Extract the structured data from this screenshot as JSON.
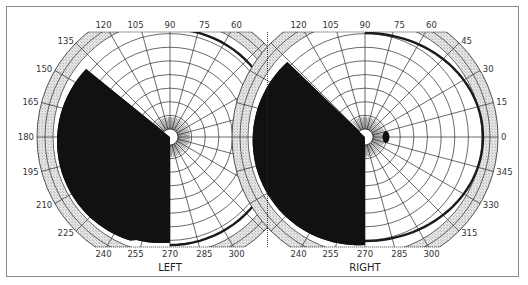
{
  "figure": {
    "type": "visual field perimetry chart (homonymous hemianopia)",
    "colors": {
      "background": "#ffffff",
      "frame": "#8a8a8a",
      "hatch_fill": "#d9d9d9",
      "grid_line": "#2a2a2a",
      "defect_fill": "#111111",
      "isopter": "#1a1a1a"
    },
    "eyes": [
      {
        "id": "left",
        "label": "LEFT",
        "center": [
          170,
          137
        ],
        "defect": "left hemifield blind (temporal), dense black field from 90 to 270 via 180, cut sloping toward 135 near top",
        "blind_spot": false,
        "angle_labels": [
          {
            "deg": 120,
            "text": "120"
          },
          {
            "deg": 105,
            "text": "105"
          },
          {
            "deg": 90,
            "text": "90"
          },
          {
            "deg": 75,
            "text": "75"
          },
          {
            "deg": 60,
            "text": "60"
          },
          {
            "deg": 135,
            "text": "135"
          },
          {
            "deg": 150,
            "text": "150"
          },
          {
            "deg": 165,
            "text": "165"
          },
          {
            "deg": 180,
            "text": "180"
          },
          {
            "deg": 195,
            "text": "195"
          },
          {
            "deg": 210,
            "text": "210"
          },
          {
            "deg": 225,
            "text": "225"
          },
          {
            "deg": 240,
            "text": "240"
          },
          {
            "deg": 255,
            "text": "255"
          },
          {
            "deg": 270,
            "text": "270"
          },
          {
            "deg": 285,
            "text": "285"
          },
          {
            "deg": 300,
            "text": "300"
          }
        ]
      },
      {
        "id": "right",
        "label": "RIGHT",
        "center": [
          365,
          137
        ],
        "defect": "left hemifield blind (nasal), dense black field from 90 to 270 via 180",
        "blind_spot": true,
        "angle_labels": [
          {
            "deg": 120,
            "text": "120"
          },
          {
            "deg": 105,
            "text": "105"
          },
          {
            "deg": 90,
            "text": "90"
          },
          {
            "deg": 75,
            "text": "75"
          },
          {
            "deg": 60,
            "text": "60"
          },
          {
            "deg": 45,
            "text": "45"
          },
          {
            "deg": 30,
            "text": "30"
          },
          {
            "deg": 15,
            "text": "15"
          },
          {
            "deg": 0,
            "text": "0"
          },
          {
            "deg": 345,
            "text": "345"
          },
          {
            "deg": 330,
            "text": "330"
          },
          {
            "deg": 315,
            "text": "315"
          },
          {
            "deg": 240,
            "text": "240"
          },
          {
            "deg": 255,
            "text": "255"
          },
          {
            "deg": 270,
            "text": "270"
          },
          {
            "deg": 285,
            "text": "285"
          },
          {
            "deg": 300,
            "text": "300"
          }
        ]
      }
    ],
    "grid": {
      "meridian_step_deg": 15,
      "ring_count": 9,
      "outer_radius_px": 133,
      "hatched_ring_inner_px": 117,
      "top_clip_y": 32,
      "bottom_clip_y": 247
    }
  }
}
